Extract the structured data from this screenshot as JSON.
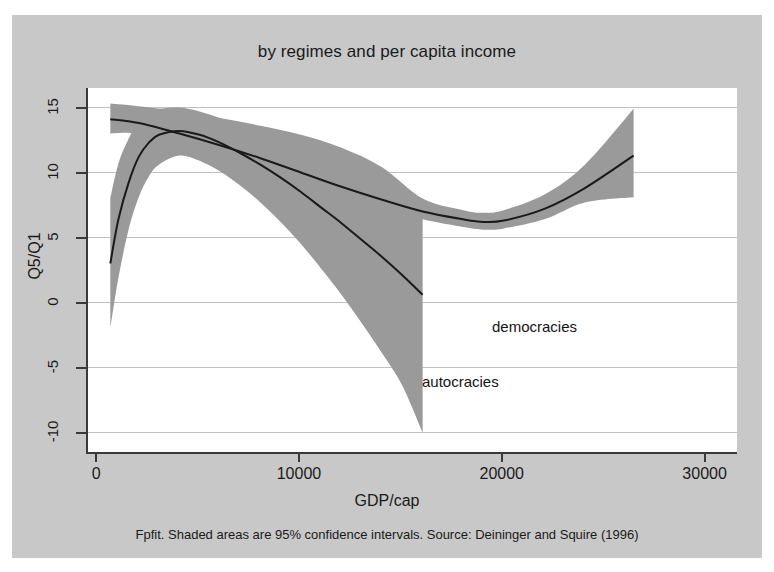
{
  "figure": {
    "title": "by regimes and per capita income",
    "note": "Fpfit. Shaded areas are 95% confidence intervals. Source: Deininger and Squire (1996)",
    "background_color": "#c8c8c8",
    "plot_background_color": "#ffffff",
    "band_color": "#9a9a9a",
    "line_color": "#1a1a1a",
    "axis_color": "#3a3a3a",
    "grid_color": "#c0c0c0"
  },
  "chart_data": {
    "type": "line",
    "title": "by regimes and per capita income",
    "subtitle": "",
    "xlabel": "GDP/cap",
    "ylabel": "Q5/Q1",
    "xlim": [
      -500,
      31500
    ],
    "ylim": [
      -11.5,
      16.5
    ],
    "xticks": [
      0,
      10000,
      20000,
      30000
    ],
    "xticklabels": [
      "0",
      "10000",
      "20000",
      "30000"
    ],
    "yticks": [
      15,
      10,
      5,
      0,
      -5,
      -10
    ],
    "yticklabels": [
      "15",
      "10",
      "5",
      "0",
      "-5",
      "-10"
    ],
    "grid": true,
    "grid_axis": "y",
    "legend": "inline-annotations",
    "annotations": [
      {
        "text": "democracies",
        "x": 19300,
        "y": 4.3
      },
      {
        "text": "autocracies",
        "x": 15800,
        "y": 0.4
      }
    ],
    "series": [
      {
        "name": "autocracies",
        "kind": "fit-line-with-ci",
        "x": [
          600,
          1000,
          1500,
          2000,
          2500,
          3000,
          4000,
          5000,
          6000,
          7000,
          8000,
          9000,
          10000,
          11000,
          12000,
          13000,
          14000,
          15000,
          16000
        ],
        "y": [
          3.0,
          6.4,
          9.2,
          11.2,
          12.3,
          12.9,
          13.2,
          12.9,
          12.3,
          11.5,
          10.6,
          9.6,
          8.5,
          7.3,
          6.1,
          4.8,
          3.5,
          2.1,
          0.6
        ],
        "ci_lower": [
          -2.0,
          1.9,
          5.6,
          8.1,
          9.7,
          10.6,
          11.3,
          10.9,
          10.1,
          9.0,
          7.7,
          6.2,
          4.5,
          2.6,
          0.6,
          -1.6,
          -3.9,
          -6.4,
          -10.0
        ],
        "ci_upper": [
          8.0,
          10.7,
          12.6,
          13.9,
          14.6,
          14.9,
          15.0,
          14.7,
          14.2,
          13.5,
          12.8,
          12.0,
          11.2,
          10.4,
          9.6,
          8.8,
          8.0,
          7.2,
          6.5
        ]
      },
      {
        "name": "democracies",
        "kind": "fit-line-with-ci",
        "x": [
          600,
          2000,
          4000,
          6000,
          8000,
          10000,
          12000,
          14000,
          16000,
          18000,
          19000,
          20000,
          22000,
          24000,
          26400
        ],
        "y": [
          14.1,
          13.8,
          13.0,
          12.1,
          11.1,
          10.0,
          8.9,
          7.9,
          7.0,
          6.4,
          6.2,
          6.3,
          7.2,
          8.8,
          11.3
        ],
        "ci_lower": [
          13.0,
          13.0,
          12.3,
          11.4,
          10.4,
          9.3,
          8.2,
          7.2,
          6.4,
          5.8,
          5.6,
          5.7,
          6.4,
          7.7,
          8.1
        ],
        "ci_upper": [
          15.3,
          15.1,
          14.7,
          14.2,
          13.6,
          12.9,
          11.9,
          10.4,
          8.0,
          7.1,
          6.9,
          7.1,
          8.3,
          10.6,
          14.9
        ]
      }
    ]
  },
  "axes": {
    "y_title": "Q5/Q1",
    "x_title": "GDP/cap"
  }
}
